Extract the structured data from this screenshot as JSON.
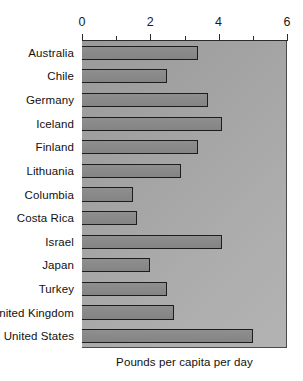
{
  "chart_data": {
    "type": "bar",
    "orientation": "horizontal",
    "title": "",
    "xlabel": "Pounds per capita per day",
    "ylabel": "",
    "xlim": [
      0,
      6
    ],
    "grid": false,
    "legend": null,
    "axis_position": "top",
    "xticks": [
      0,
      1,
      2,
      3,
      4,
      5,
      6
    ],
    "xtick_labels": [
      "0",
      "",
      "2",
      "",
      "4",
      "",
      "6"
    ],
    "categories": [
      "Australia",
      "Chile",
      "Germany",
      "Iceland",
      "Finland",
      "Lithuania",
      "Columbia",
      "Costa Rica",
      "Israel",
      "Japan",
      "Turkey",
      "United Kingdom",
      "United States"
    ],
    "values": [
      3.4,
      2.5,
      3.7,
      4.1,
      3.4,
      2.9,
      1.5,
      1.6,
      4.1,
      2.0,
      2.5,
      2.7,
      5.0
    ]
  },
  "colors": {
    "bar_fill": "#8a8a8a",
    "bar_stroke": "#1d1d1d",
    "plot_background": "#a6a6a6",
    "axis_line": "#2b2b2b",
    "text": "#111111",
    "page_background": "#ffffff"
  }
}
